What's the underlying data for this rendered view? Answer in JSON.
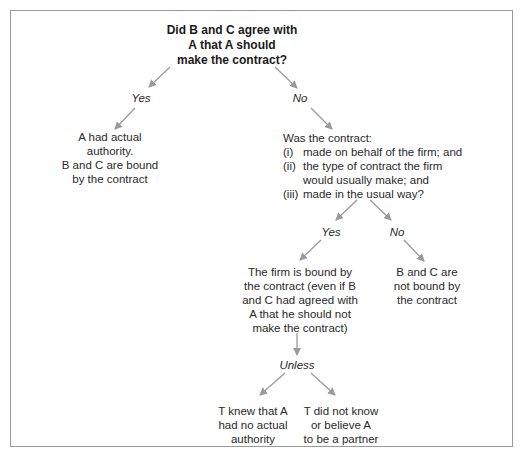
{
  "diagram": {
    "type": "decision-flowchart",
    "root_question": {
      "lines": [
        "Did B and C agree with",
        "A that A should",
        "make the contract?"
      ]
    },
    "branch_yes": {
      "label": "Yes",
      "outcome_lines": [
        "A had actual",
        "authority.",
        "B and C are bound",
        "by the contract"
      ]
    },
    "branch_no": {
      "label": "No",
      "question": {
        "intro": "Was the contract:",
        "items": [
          {
            "num": "(i)",
            "lines": [
              "made on behalf of the firm; and"
            ]
          },
          {
            "num": "(ii)",
            "lines": [
              "the type of contract the firm",
              "would usually make; and"
            ]
          },
          {
            "num": "(iii)",
            "lines": [
              "made in the usual way?"
            ]
          }
        ]
      },
      "sub_yes": {
        "label": "Yes",
        "outcome_lines": [
          "The firm is bound by",
          "the contract (even if B",
          "and C had agreed with",
          "A that he should not",
          "make the contract)"
        ],
        "exception_label": "Unless",
        "exceptions": [
          {
            "lines": [
              "T knew that A",
              "had no actual",
              "authority"
            ]
          },
          {
            "lines": [
              "T did not know",
              "or believe A",
              "to be a partner"
            ]
          }
        ]
      },
      "sub_no": {
        "label": "No",
        "outcome_lines": [
          "B and C are",
          "not bound by",
          "the contract"
        ]
      }
    },
    "colors": {
      "arrow": "#9a9a9a",
      "frame": "#9a9a9a",
      "text": "#2a2a2a"
    }
  }
}
